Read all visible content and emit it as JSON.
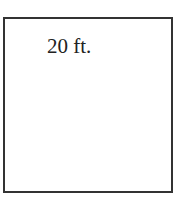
{
  "diagram": {
    "shape": "square",
    "label": "20 ft.",
    "stroke_color": "#333333",
    "fill_color": "#ffffff"
  }
}
